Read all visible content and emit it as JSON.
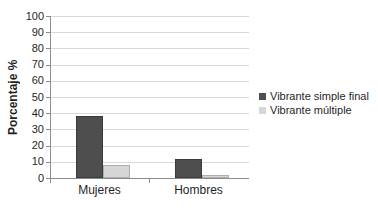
{
  "chart_data": {
    "type": "bar",
    "title": "",
    "categories": [
      "Mujeres",
      "Hombres"
    ],
    "series": [
      {
        "name": "Vibrante simple final",
        "values": [
          38,
          12
        ],
        "color": "#4e4e4e",
        "border_color": "#3a3a3a"
      },
      {
        "name": "Vibrante múltiple",
        "values": [
          8,
          2
        ],
        "color": "#d6d6d6",
        "border_color": "#aeaeae"
      }
    ],
    "ylabel": "Porcentaje %",
    "ylim": [
      0,
      100
    ],
    "ytick_step": 10,
    "grid": "horizontal",
    "legend_position": "right",
    "gridline_color": "#d9d9d9",
    "axis_color": "#8c8c8c",
    "text_color": "#1f1f1f",
    "background_color": "#ffffff"
  }
}
